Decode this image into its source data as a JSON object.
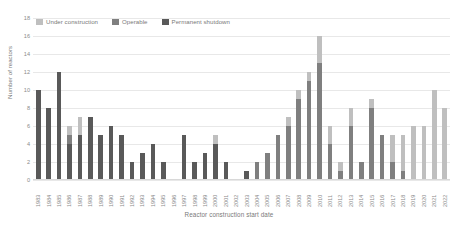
{
  "chart_data": {
    "type": "bar",
    "title": "",
    "subtitle": "",
    "xlabel": "Reactor construction start date",
    "ylabel": "Number of reactors",
    "ylim": [
      0,
      18
    ],
    "ytick_step": 2,
    "yticks": [
      "0",
      "2",
      "4",
      "6",
      "8",
      "10",
      "12",
      "14",
      "16",
      "18"
    ],
    "grid": true,
    "stacked": true,
    "legend_position": "top-left",
    "legend": [
      "Under construction",
      "Operable",
      "Permanent shutdown"
    ],
    "colors": {
      "under_construction": "#bfbfbf",
      "operable": "#7f7f7f",
      "permanent_shutdown": "#595959",
      "gridline": "#e8e8e8",
      "text": "#7a7a7a"
    },
    "categories": [
      "1983",
      "1984",
      "1985",
      "1986",
      "1987",
      "1988",
      "1989",
      "1990",
      "1991",
      "1992",
      "1993",
      "1994",
      "1995",
      "1996",
      "1997",
      "1998",
      "1999",
      "2000",
      "2001",
      "2002",
      "2003",
      "2004",
      "2005",
      "2006",
      "2007",
      "2008",
      "2009",
      "2010",
      "2011",
      "2012",
      "2013",
      "2014",
      "2015",
      "2016",
      "2017",
      "2018",
      "2019",
      "2020",
      "2021",
      "2022"
    ],
    "series": [
      {
        "name": "Permanent shutdown",
        "values": [
          10,
          8,
          12,
          4,
          5,
          7,
          5,
          6,
          5,
          2,
          3,
          4,
          2,
          0,
          5,
          2,
          3,
          4,
          2,
          0,
          1,
          0,
          0,
          0,
          0,
          0,
          0,
          0,
          0,
          0,
          0,
          0,
          0,
          0,
          0,
          0,
          0,
          0,
          0,
          0
        ]
      },
      {
        "name": "Operable",
        "values": [
          0,
          0,
          0,
          1,
          0,
          0,
          0,
          0,
          0,
          0,
          0,
          0,
          0,
          0,
          0,
          0,
          0,
          0,
          0,
          0,
          0,
          2,
          3,
          5,
          6,
          9,
          11,
          13,
          4,
          1,
          6,
          2,
          8,
          5,
          2,
          1,
          0,
          0,
          0,
          0
        ]
      },
      {
        "name": "Under construction",
        "values": [
          0,
          0,
          0,
          1,
          2,
          0,
          0,
          0,
          0,
          0,
          0,
          0,
          0,
          0,
          0,
          0,
          0,
          1,
          0,
          0,
          0,
          0,
          0,
          0,
          1,
          1,
          1,
          3,
          2,
          1,
          2,
          0,
          1,
          0,
          3,
          4,
          6,
          6,
          10,
          8
        ]
      }
    ],
    "totals": [
      10,
      8,
      12,
      6,
      7,
      7,
      5,
      6,
      5,
      2,
      3,
      4,
      2,
      0,
      5,
      2,
      3,
      5,
      2,
      0,
      1,
      2,
      3,
      5,
      7,
      10,
      12,
      16,
      6,
      2,
      8,
      2,
      9,
      5,
      5,
      5,
      6,
      6,
      10,
      8
    ]
  }
}
